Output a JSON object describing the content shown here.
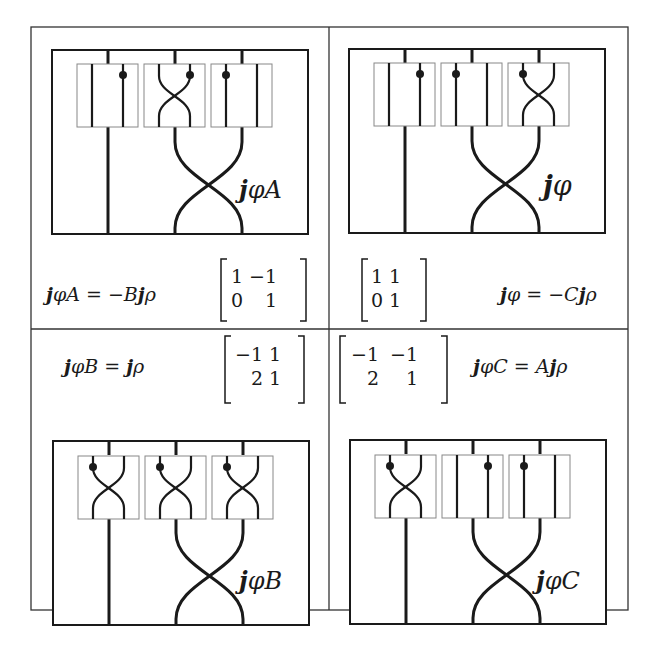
{
  "figure": {
    "panels": [
      {
        "id": "top-left",
        "diagram_label": "jφA",
        "equation": "jφA = −Bjρ",
        "matrix": [
          [
            "1",
            "−1"
          ],
          [
            "0",
            "1"
          ]
        ],
        "boxes": [
          "straight-dot-right",
          "crossing-dot-right",
          "straight-dot-left"
        ]
      },
      {
        "id": "top-right",
        "diagram_label": "jφ",
        "equation": "jφ = −Cjρ",
        "matrix": [
          [
            "1",
            "1"
          ],
          [
            "0",
            "1"
          ]
        ],
        "boxes": [
          "straight-dot-right",
          "straight-dot-left",
          "crossing-dot-left"
        ]
      },
      {
        "id": "bottom-left",
        "diagram_label": "jφB",
        "equation": "jφB = jρ",
        "matrix": [
          [
            "−1",
            "1"
          ],
          [
            "2",
            "1"
          ]
        ],
        "boxes": [
          "crossing-dot-left",
          "crossing-dot-left",
          "crossing-dot-left"
        ]
      },
      {
        "id": "bottom-right",
        "diagram_label": "jφC",
        "equation": "jφC = Ajρ",
        "matrix": [
          [
            "−1",
            "−1"
          ],
          [
            "2",
            "1"
          ]
        ],
        "boxes": [
          "crossing-dot-left",
          "straight-dot-right",
          "straight-dot-left"
        ]
      }
    ],
    "labels": {
      "tl_j": "j",
      "tl_rest": "φA",
      "tr_j": "j",
      "tr_rest": "φ",
      "bl_j": "j",
      "bl_rest": "φB",
      "br_j": "j",
      "br_rest": "φC"
    },
    "equations": {
      "tl": {
        "j1": "j",
        "a": "φA = −B",
        "j2": "j",
        "b": "ρ"
      },
      "tr": {
        "j1": "j",
        "a": "φ = −C",
        "j2": "j",
        "b": "ρ"
      },
      "bl": {
        "j1": "j",
        "a": "φB = ",
        "j2": "j",
        "b": "ρ"
      },
      "br": {
        "j1": "j",
        "a": "φC = A",
        "j2": "j",
        "b": "ρ"
      }
    },
    "matrices": {
      "tl": {
        "r0c0": "1",
        "r0c1": "−1",
        "r1c0": "0",
        "r1c1": "1"
      },
      "tr": {
        "r0c0": "1",
        "r0c1": "1",
        "r1c0": "0",
        "r1c1": "1"
      },
      "bl": {
        "r0c0": "−1",
        "r0c1": "1",
        "r1c0": "2",
        "r1c1": "1"
      },
      "br": {
        "r0c0": "−1",
        "r0c1": "−1",
        "r1c0": "2",
        "r1c1": "1"
      }
    },
    "colors": {
      "ink": "#1a1a1a",
      "box_border": "#888888",
      "background": "#ffffff"
    }
  }
}
